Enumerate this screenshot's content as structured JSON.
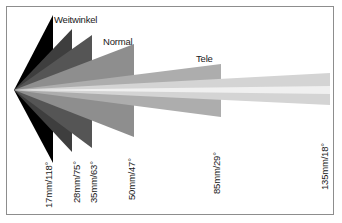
{
  "diagram": {
    "title_alt": "Angle of view by focal length",
    "canvas": {
      "width": 342,
      "height": 223,
      "background": "#ffffff",
      "border_color": "#8d8d8d"
    },
    "apex": {
      "x": 14,
      "y": 90
    },
    "category_labels": [
      {
        "id": "weitwinkel",
        "text": "Weitwinkel",
        "x": 54,
        "y": 14,
        "color": "#1a1a1a"
      },
      {
        "id": "normal",
        "text": "Normal",
        "x": 103,
        "y": 36,
        "color": "#1a1a1a"
      },
      {
        "id": "tele",
        "text": "Tele",
        "x": 196,
        "y": 53,
        "color": "#1a1a1a"
      }
    ],
    "lenses": [
      {
        "id": "lens-17",
        "label": "17mm/118°",
        "focal_length_mm": 17,
        "angle_of_view_deg": 118,
        "fill": "#000000",
        "tip_x": 53,
        "top_y": 15,
        "bottom_y": 163,
        "label_x": 43,
        "label_y": 208
      },
      {
        "id": "lens-28",
        "label": "28mm/75°",
        "focal_length_mm": 28,
        "angle_of_view_deg": 75,
        "fill": "#3e3e3e",
        "tip_x": 72,
        "top_y": 29,
        "bottom_y": 152,
        "label_x": 71,
        "label_y": 203
      },
      {
        "id": "lens-35",
        "label": "35mm/63°",
        "focal_length_mm": 35,
        "angle_of_view_deg": 63,
        "fill": "#555555",
        "tip_x": 92,
        "top_y": 35,
        "bottom_y": 148,
        "label_x": 88,
        "label_y": 203
      },
      {
        "id": "lens-50",
        "label": "50mm/47°",
        "focal_length_mm": 50,
        "angle_of_view_deg": 47,
        "fill": "#8e8e8e",
        "tip_x": 134,
        "top_y": 44,
        "bottom_y": 137,
        "label_x": 126,
        "label_y": 200
      },
      {
        "id": "lens-85",
        "label": "85mm/29°",
        "focal_length_mm": 85,
        "angle_of_view_deg": 29,
        "fill": "#adadad",
        "tip_x": 221,
        "top_y": 64,
        "bottom_y": 117,
        "label_x": 211,
        "label_y": 194
      },
      {
        "id": "lens-135",
        "label": "135mm/18°",
        "focal_length_mm": 135,
        "angle_of_view_deg": 18,
        "fill": "#d4d4d4",
        "tip_x": 330,
        "top_y": 73,
        "bottom_y": 105,
        "label_x": 319,
        "label_y": 190
      }
    ],
    "highlight_band": {
      "fill": "#f0f0f0",
      "tip_x": 330,
      "top_y": 86,
      "bottom_y": 94
    }
  }
}
